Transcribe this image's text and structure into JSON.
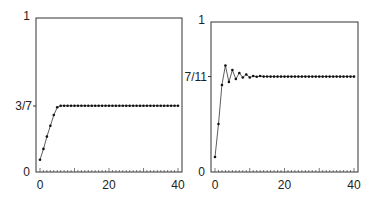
{
  "chart_data": [
    {
      "type": "line",
      "title": "",
      "xlabel": "",
      "ylabel": "",
      "xlim": [
        0,
        40
      ],
      "ylim": [
        0,
        1
      ],
      "x_ticks": [
        "0",
        "20",
        "40"
      ],
      "y_ticks": [
        "0",
        "3/7",
        "1"
      ],
      "limit_label": "3/7",
      "limit_value": 0.4286,
      "x": [
        0,
        1,
        2,
        3,
        4,
        5,
        6,
        7,
        8,
        9,
        10,
        11,
        12,
        13,
        14,
        15,
        16,
        17,
        18,
        19,
        20,
        21,
        22,
        23,
        24,
        25,
        26,
        27,
        28,
        29,
        30,
        31,
        32,
        33,
        34,
        35,
        36,
        37,
        38,
        39,
        40
      ],
      "values": [
        0.08,
        0.15,
        0.23,
        0.3,
        0.37,
        0.42,
        0.43,
        0.43,
        0.43,
        0.43,
        0.43,
        0.43,
        0.43,
        0.43,
        0.43,
        0.43,
        0.43,
        0.43,
        0.43,
        0.43,
        0.43,
        0.43,
        0.43,
        0.43,
        0.43,
        0.43,
        0.43,
        0.43,
        0.43,
        0.43,
        0.43,
        0.43,
        0.43,
        0.43,
        0.43,
        0.43,
        0.43,
        0.43,
        0.43,
        0.43,
        0.43
      ],
      "grid": false
    },
    {
      "type": "line",
      "title": "",
      "xlabel": "",
      "ylabel": "",
      "xlim": [
        0,
        40
      ],
      "ylim": [
        0,
        1
      ],
      "x_ticks": [
        "0",
        "20",
        "40"
      ],
      "y_ticks": [
        "0",
        "7/11",
        "1"
      ],
      "limit_label": "7/11",
      "limit_value": 0.6364,
      "x": [
        0,
        1,
        2,
        3,
        4,
        5,
        6,
        7,
        8,
        9,
        10,
        11,
        12,
        13,
        14,
        15,
        16,
        17,
        18,
        19,
        20,
        21,
        22,
        23,
        24,
        25,
        26,
        27,
        28,
        29,
        30,
        31,
        32,
        33,
        34,
        35,
        36,
        37,
        38,
        39,
        40
      ],
      "values": [
        0.1,
        0.32,
        0.58,
        0.71,
        0.6,
        0.68,
        0.62,
        0.66,
        0.63,
        0.65,
        0.63,
        0.64,
        0.635,
        0.64,
        0.636,
        0.637,
        0.636,
        0.636,
        0.636,
        0.636,
        0.636,
        0.636,
        0.636,
        0.636,
        0.636,
        0.636,
        0.636,
        0.636,
        0.636,
        0.636,
        0.636,
        0.636,
        0.636,
        0.636,
        0.636,
        0.636,
        0.636,
        0.636,
        0.636,
        0.636,
        0.636
      ],
      "grid": false
    }
  ]
}
